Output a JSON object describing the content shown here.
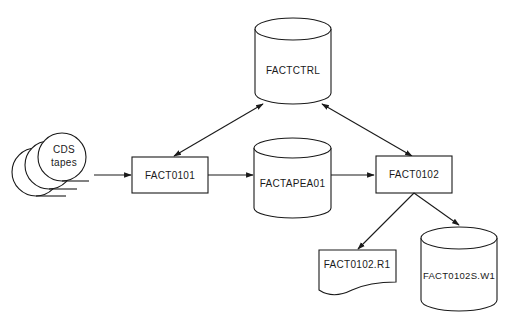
{
  "diagram": {
    "type": "data-flow",
    "nodes": {
      "tapes": {
        "label_line1": "CDS",
        "label_line2": "tapes",
        "shape": "tape-reels"
      },
      "factctrl": {
        "label": "FACTCTRL",
        "shape": "cylinder"
      },
      "fact0101": {
        "label": "FACT0101",
        "shape": "process-box"
      },
      "factapea01": {
        "label": "FACTAPEA01",
        "shape": "cylinder"
      },
      "fact0102": {
        "label": "FACT0102",
        "shape": "process-box"
      },
      "fact0102_r1": {
        "label": "FACT0102.R1",
        "shape": "document"
      },
      "fact0102s_w1": {
        "label": "FACT0102S.W1",
        "shape": "cylinder"
      }
    },
    "edges": [
      {
        "from": "CDS tapes",
        "to": "FACT0101",
        "direction": "forward"
      },
      {
        "from": "FACT0101",
        "to": "FACTAPEA01",
        "direction": "forward"
      },
      {
        "from": "FACTAPEA01",
        "to": "FACT0102",
        "direction": "forward"
      },
      {
        "from": "FACT0101",
        "to": "FACTCTRL",
        "direction": "bidirectional"
      },
      {
        "from": "FACT0102",
        "to": "FACTCTRL",
        "direction": "bidirectional"
      },
      {
        "from": "FACT0102",
        "to": "FACT0102.R1",
        "direction": "forward"
      },
      {
        "from": "FACT0102",
        "to": "FACT0102S.W1",
        "direction": "forward"
      }
    ]
  }
}
